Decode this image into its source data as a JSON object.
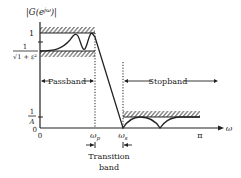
{
  "diagram": {
    "type": "lowpass-filter-specification",
    "y_axis_label": "|G(e^{jω})|",
    "y_axis_label_parts": {
      "G": "|G(e",
      "sup": "jω",
      "close": ")|"
    },
    "x_axis_label": "ω",
    "y_ticks": {
      "one": "1",
      "passband_min_num": "1",
      "passband_min_den": "√1 + ε²",
      "stopband_max_num": "1",
      "stopband_max_den": "A",
      "zero": "0"
    },
    "x_ticks": {
      "origin": "0",
      "omega_p": "ωp",
      "omega_p_main": "ω",
      "omega_p_sub": "p",
      "omega_s_main": "ω",
      "omega_s_sub": "s",
      "pi": "π"
    },
    "regions": {
      "passband": "Passband",
      "stopband": "Stopband",
      "transition_line1": "Transition",
      "transition_line2": "band"
    },
    "colors": {
      "ink": "#222222",
      "background": "#ffffff"
    }
  }
}
